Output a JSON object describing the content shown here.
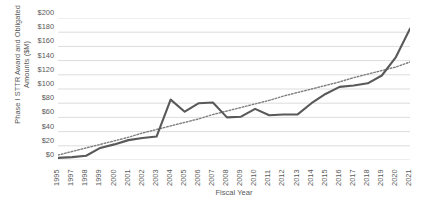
{
  "chart_data": {
    "type": "line",
    "title": "",
    "xlabel": "Fiscal Year",
    "ylabel": "Phase I STTR Award and Obligated Amounts ($M)",
    "categories": [
      "1995",
      "1997",
      "1998",
      "1999",
      "2000",
      "2001",
      "2002",
      "2003",
      "2004",
      "2005",
      "2006",
      "2007",
      "2008",
      "2009",
      "2010",
      "2011",
      "2012",
      "2013",
      "2014",
      "2015",
      "2016",
      "2017",
      "2018",
      "2019",
      "2020",
      "2021"
    ],
    "series": [
      {
        "name": "Phase I STTR Award and Obligated Amounts",
        "style": "solid",
        "color": "#595959",
        "values": [
          3,
          4,
          6,
          17,
          22,
          28,
          31,
          33,
          85,
          68,
          80,
          81,
          60,
          61,
          72,
          63,
          64,
          64,
          80,
          93,
          103,
          105,
          108,
          119,
          145,
          185
        ]
      },
      {
        "name": "Linear trendline",
        "style": "dotted",
        "color": "#7f7f7f",
        "values": [
          7,
          12,
          17,
          22,
          27,
          32,
          38,
          43,
          48,
          53,
          58,
          64,
          69,
          74,
          79,
          84,
          90,
          95,
          100,
          105,
          110,
          116,
          121,
          126,
          131,
          138
        ]
      }
    ],
    "ylim": [
      0,
      200
    ],
    "ytick_step": 20,
    "ytick_labels": [
      "$200",
      "$180",
      "$160",
      "$140",
      "$120",
      "$100",
      "$80",
      "$60",
      "$40",
      "$20",
      "$0"
    ],
    "ytick_values": [
      200,
      180,
      160,
      140,
      120,
      100,
      80,
      60,
      40,
      20,
      0
    ],
    "grid": "horizontal",
    "grid_color": "#d9d9d9",
    "legend": "none",
    "axis_label_color": "#595959",
    "background": "#ffffff"
  }
}
